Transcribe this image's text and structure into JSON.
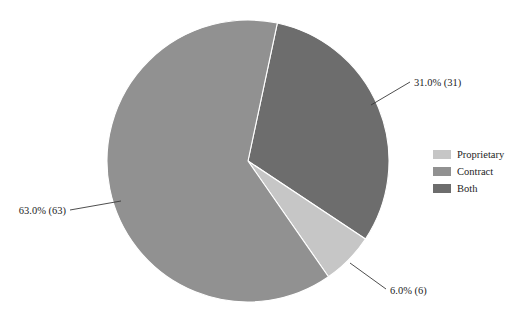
{
  "chart_data": {
    "type": "pie",
    "title": "",
    "subtitle": "",
    "xlabel": "",
    "ylabel": "",
    "grid": false,
    "legend_position": "right",
    "start_angle_deg": -78,
    "direction": "clockwise",
    "categories": [
      "Proprietary",
      "Contract",
      "Both"
    ],
    "values": [
      6.0,
      63.0,
      31.0
    ],
    "counts": [
      6,
      63,
      31
    ],
    "total_count": 100,
    "units": "percent",
    "colors": [
      "#c6c6c6",
      "#919191",
      "#6d6d6d"
    ],
    "slices": [
      {
        "name": "Proprietary",
        "percent": 6.0,
        "count": 6,
        "label": "6.0% (6)",
        "color": "#c6c6c6"
      },
      {
        "name": "Contract",
        "percent": 63.0,
        "count": 63,
        "label": "63.0% (63)",
        "color": "#919191"
      },
      {
        "name": "Both",
        "percent": 31.0,
        "count": 31,
        "label": "31.0% (31)",
        "color": "#6d6d6d"
      }
    ],
    "annotations": [
      {
        "text": "31.0% (31)",
        "for": "Both"
      },
      {
        "text": "6.0% (6)",
        "for": "Proprietary"
      },
      {
        "text": "63.0% (63)",
        "for": "Contract"
      }
    ]
  },
  "legend": {
    "entries": [
      {
        "label": "Proprietary",
        "color": "#c6c6c6"
      },
      {
        "label": "Contract",
        "color": "#919191"
      },
      {
        "label": "Both",
        "color": "#6d6d6d"
      }
    ]
  },
  "figure": {
    "background": "#ffffff",
    "label_color": "#1d1d1d",
    "leader_color": "#3a3a3a",
    "slice_border": "#ffffff"
  }
}
